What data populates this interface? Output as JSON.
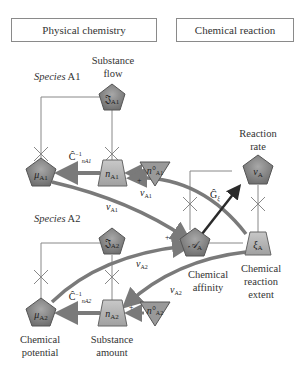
{
  "headers": {
    "left": "Physical chemistry",
    "right": "Chemical reaction"
  },
  "labels": {
    "substance_flow": "Substance flow",
    "species_a1": "Species A1",
    "species_a1_italic": "Species",
    "species_a1_name": "A1",
    "species_a2_italic": "Species",
    "species_a2_name": "A2",
    "reaction_rate": "Reaction rate",
    "chemical_affinity": "Chemical affinity",
    "chemical_reaction_extent": "Chemical reaction extent",
    "chemical_potential": "Chemical potential",
    "substance_amount": "Substance amount"
  },
  "nodes": {
    "J_A1_top": "𝔍A1",
    "mu_A1": "μA1",
    "n_A1": "nA1",
    "n0_A1": "n°A1",
    "J_A2": "𝔍A2",
    "mu_A2": "μA2",
    "n_A2": "nA2",
    "n0_A2": "n°A2",
    "A_A": "𝒜A",
    "v_A": "vA",
    "xi_A": "ξA"
  },
  "edge_labels": {
    "C_A1": "Ĉ⁻¹nA1",
    "C_A2": "Ĉ⁻¹nA2",
    "nu_A1_upper": "νA1",
    "nu_A1_lower": "νA1",
    "nu_A2_upper": "νA2",
    "nu_A2_lower": "νA2",
    "G_xi": "Ĝξ",
    "plus": "+"
  },
  "colors": {
    "node_fill": "#8c8c8c",
    "node_fill_light": "#b8b8b8",
    "arrow_gray": "#7a7a7a",
    "arrow_dark": "#2a2a2a",
    "line": "#888888"
  }
}
